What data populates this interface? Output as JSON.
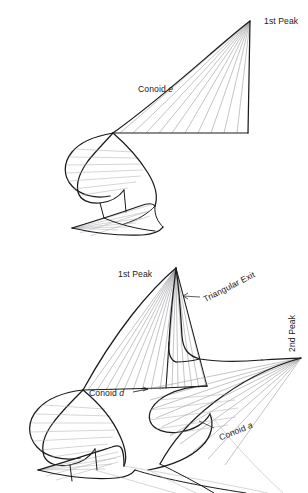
{
  "figure": {
    "type": "line-drawing",
    "panels": [
      {
        "id": "upper",
        "name": "upper-conoid-panel",
        "labels": [
          {
            "id": "peak1",
            "text": "1st Peak",
            "rotation": 0
          },
          {
            "id": "conoid_e",
            "text": "Conoid ",
            "italic": "e",
            "rotation": 0
          }
        ]
      },
      {
        "id": "lower",
        "name": "lower-conoid-panel",
        "labels": [
          {
            "id": "peak1",
            "text": "1st Peak",
            "rotation": 0
          },
          {
            "id": "tri_exit",
            "text": "Triangular Exit",
            "rotation": -27,
            "leader": "arrow-left"
          },
          {
            "id": "peak2",
            "text": "2nd Peak",
            "rotation": -90
          },
          {
            "id": "conoid_d",
            "text": "Conoid ",
            "italic": "d",
            "rotation": 0,
            "leader": "arrow-right"
          },
          {
            "id": "conoid_a",
            "text": "Conoid ",
            "italic": "a",
            "rotation": -22,
            "leader": "line-left"
          }
        ]
      }
    ],
    "colors": {
      "background": "#ffffff",
      "outline": "#1b1b1b",
      "ruling": "#8d8d92",
      "ruling_light": "#a9a9ae",
      "text": "#1b1b1b"
    }
  },
  "labels": {
    "upper_peak1": "1st Peak",
    "upper_conoid_word": "Conoid",
    "upper_conoid_letter": "e",
    "lower_peak1": "1st Peak",
    "lower_peak2": "2nd Peak",
    "lower_triangular_exit": "Triangular Exit",
    "lower_conoid_d_word": "Conoid",
    "lower_conoid_d_letter": "d",
    "lower_conoid_a_word": "Conoid",
    "lower_conoid_a_letter": "a"
  }
}
